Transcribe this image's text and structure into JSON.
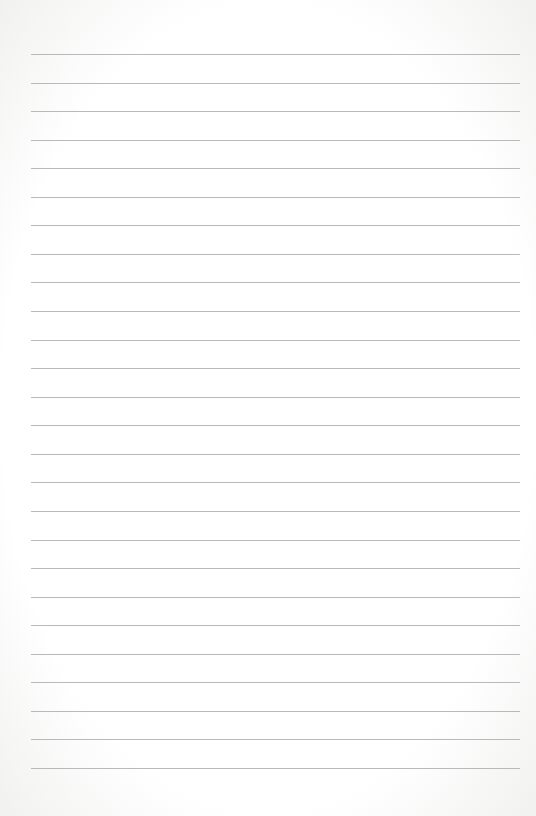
{
  "paper": {
    "type": "lined-paper",
    "line_count": 26,
    "first_line_y": 54,
    "line_spacing": 28.56,
    "line_left": 31,
    "line_right": 520,
    "line_color": "#b9b9b9",
    "background_color": "#ffffff"
  }
}
